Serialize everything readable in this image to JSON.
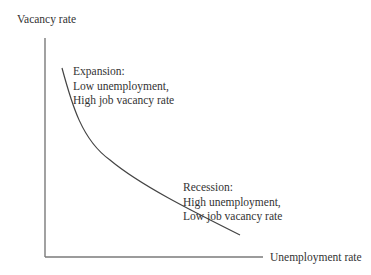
{
  "diagram": {
    "title": "",
    "axes": {
      "y_label": "Vacancy rate",
      "x_label": "Unemployment rate"
    },
    "curve": {
      "name": "Beveridge curve",
      "shape": "convex downward-sloping",
      "color": "#444444"
    },
    "annotations": {
      "expansion": {
        "heading": "Expansion:",
        "line1": "Low unemployment,",
        "line2": "High job vacancy rate"
      },
      "recession": {
        "heading": "Recession:",
        "line1": "High unemployment,",
        "line2": "Low job vacancy rate"
      }
    },
    "colors": {
      "axis": "#7a7a7a",
      "text": "#333333",
      "background": "#ffffff"
    }
  }
}
